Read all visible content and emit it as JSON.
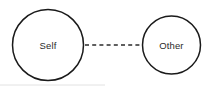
{
  "diagram": {
    "background_color": "#ffffff",
    "stroke_color": "#1a1a1a",
    "label_color": "#2b2b2b",
    "nodes": [
      {
        "id": "self",
        "label": "Self",
        "cx": 48,
        "cy": 45,
        "r": 35.5
      },
      {
        "id": "other",
        "label": "Other",
        "cx": 171.5,
        "cy": 45,
        "r": 29
      }
    ],
    "link": {
      "id": "self-other-link",
      "style": "dashed",
      "x1": 85,
      "y1": 45,
      "x2": 141,
      "y2": 45,
      "color": "#2b2b2b"
    },
    "baseline": {
      "x1": 0,
      "y1": 85,
      "x2": 105,
      "y2": 85,
      "color": "#e2e2e2"
    }
  }
}
